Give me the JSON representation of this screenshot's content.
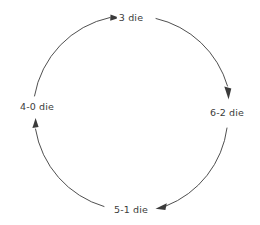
{
  "diagram": {
    "type": "cycle",
    "direction": "clockwise",
    "background_color": "#ffffff",
    "stroke_color": "#3b3b3b",
    "text_color": "#3b3b3b",
    "nodes": [
      {
        "id": "top",
        "label": "3 die",
        "position": "top"
      },
      {
        "id": "right",
        "label": "6-2 die",
        "position": "right"
      },
      {
        "id": "bottom",
        "label": "5-1 die",
        "position": "bottom"
      },
      {
        "id": "left",
        "label": "4-0 die",
        "position": "left"
      }
    ],
    "edges": [
      {
        "from": "left",
        "to": "top",
        "arrow": "arrowhead-right"
      },
      {
        "from": "top",
        "to": "right",
        "arrow": "arrowhead-down"
      },
      {
        "from": "right",
        "to": "bottom",
        "arrow": "arrowhead-left"
      },
      {
        "from": "bottom",
        "to": "left",
        "arrow": "arrowhead-up"
      }
    ]
  }
}
